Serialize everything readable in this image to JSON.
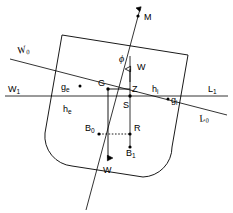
{
  "figure": {
    "type": "diagram",
    "width": 233,
    "height": 213,
    "background": "#ffffff",
    "ink_color": "#000000"
  },
  "labels": {
    "metacentre": "M",
    "heel_angle": "ϕ",
    "weight_up": "W",
    "weight_down": "W",
    "centre_of_gravity": "G",
    "point_z": "Z",
    "point_s": "S",
    "point_r": "R",
    "buoyancy_upright": "B",
    "buoyancy_upright_sub": "0",
    "buoyancy_heeled": "B",
    "buoyancy_heeled_sub": "1",
    "waterline_w0": "W",
    "waterline_w0_sub": "0",
    "waterline_w1": "W",
    "waterline_w1_sub": "1",
    "waterline_l0": "L",
    "waterline_l0_sub": "0",
    "waterline_l1": "L",
    "waterline_l1_sub": "1",
    "freeboard_emerged": "h",
    "freeboard_emerged_sub": "e",
    "freeboard_immersed": "h",
    "freeboard_immersed_sub": "i",
    "centroid_emerged": "g",
    "centroid_emerged_sub": "e",
    "centroid_immersed": "g",
    "centroid_immersed_sub": "i"
  },
  "geometry": {
    "hull": {
      "corner_top_left": [
        62,
        35
      ],
      "corner_top_right": [
        188,
        55
      ],
      "corner_bottom_right": [
        166,
        178
      ],
      "corner_bottom_left": [
        41,
        158
      ],
      "bilge_radius": 30
    },
    "waterline_upright": {
      "from": [
        10,
        59
      ],
      "to": [
        227,
        115
      ]
    },
    "waterline_heeled": {
      "from": [
        5,
        96
      ],
      "to": [
        228,
        96
      ]
    },
    "mast_line": {
      "from": [
        141,
        4
      ],
      "to": [
        86,
        210
      ]
    },
    "vertical_line": {
      "from": [
        130,
        60
      ],
      "to": [
        130,
        152
      ]
    },
    "gz_line": {
      "from": [
        108,
        89
      ],
      "to": [
        130,
        89
      ]
    },
    "g_drop_line": {
      "from": [
        108,
        89
      ],
      "to": [
        108,
        160
      ]
    },
    "b_dotted_line": {
      "from": [
        99,
        134
      ],
      "to": [
        130,
        134
      ]
    },
    "points": {
      "M": [
        138,
        16
      ],
      "G": [
        108,
        89
      ],
      "Z": [
        130,
        89
      ],
      "S": [
        130,
        97
      ],
      "R": [
        130,
        134
      ],
      "B0": [
        99,
        134
      ],
      "B1": [
        130,
        147
      ],
      "ge": [
        80,
        87
      ],
      "gi": [
        170,
        100
      ]
    }
  },
  "arrows": {
    "weight_up": {
      "tip": [
        130,
        71
      ],
      "direction": "up"
    },
    "weight_down": {
      "tip": [
        108,
        160
      ],
      "direction": "down"
    },
    "mast_top": {
      "tip": [
        141,
        4
      ],
      "direction": "up"
    }
  }
}
